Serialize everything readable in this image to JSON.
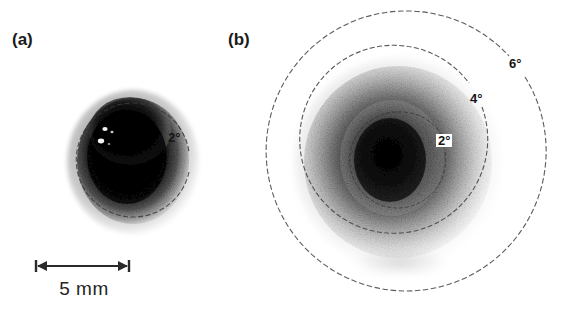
{
  "figure": {
    "background_color": "#ffffff",
    "width": 563,
    "height": 333
  },
  "panels": [
    {
      "id": "a",
      "label": "(a)",
      "blob": {
        "shape": "oval",
        "center_x": 133,
        "center_y": 160,
        "radius_x": 56,
        "radius_y": 62,
        "peak_color": "#0a0a0a"
      },
      "rings": [
        {
          "name": "2-degree-ring",
          "label": "2°",
          "degrees": 2,
          "center_x": 133,
          "center_y": 160,
          "radius": 57,
          "label_x": 168,
          "label_y": 137,
          "boxed": false
        }
      ],
      "scalebar": {
        "label": "5 mm",
        "value": 5,
        "unit": "mm",
        "x_start": 36,
        "x_end": 129,
        "y": 266
      }
    },
    {
      "id": "b",
      "label": "(b)",
      "blob": {
        "shape": "circle",
        "center_x": 398,
        "center_y": 162,
        "radius_x": 94,
        "radius_y": 96,
        "peak_color": "#141414"
      },
      "rings": [
        {
          "name": "2-degree-ring",
          "label": "2°",
          "degrees": 2,
          "center_x": 398,
          "center_y": 160,
          "radius": 48,
          "label_x": 437,
          "label_y": 140,
          "boxed": true
        },
        {
          "name": "4-degree-ring",
          "label": "4°",
          "degrees": 4,
          "center_x": 404,
          "center_y": 156,
          "radius": 94,
          "label_x": 473,
          "label_y": 98,
          "boxed": false
        },
        {
          "name": "6-degree-ring",
          "label": "6°",
          "degrees": 6,
          "center_x": 404,
          "center_y": 155,
          "radius": 140,
          "label_x": 511,
          "label_y": 63,
          "boxed": false
        }
      ]
    }
  ],
  "colors": {
    "ring_stroke": "#4b4b4b",
    "ring_stroke_inner": "#5a5a5a",
    "text": "#1a1a1a",
    "scalebar_stroke": "#2a2a2a"
  }
}
